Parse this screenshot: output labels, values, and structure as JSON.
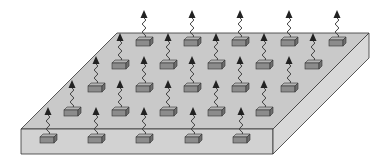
{
  "diagram": {
    "title": "",
    "colors": {
      "background": "#ffffff",
      "slab_top": "#c9c9c9",
      "slab_front": "#d2d2d2",
      "slab_side": "#d8d8d8",
      "slab_edge": "#333333",
      "node_fill": "#8c8c8c",
      "node_top": "#b4b4b4",
      "signal": "#444444",
      "arrow": "#222222"
    },
    "slab": {
      "top_face": [
        [
          117,
          33
        ],
        [
          369,
          33
        ],
        [
          273,
          129
        ],
        [
          21,
          129
        ]
      ],
      "front_face": [
        [
          21,
          129
        ],
        [
          273,
          129
        ],
        [
          273,
          154
        ],
        [
          21,
          154
        ]
      ],
      "side_face": [
        [
          273,
          129
        ],
        [
          369,
          33
        ],
        [
          369,
          58
        ],
        [
          273,
          154
        ]
      ]
    },
    "nodes": [
      {
        "row": 1,
        "x": 144,
        "y": 42
      },
      {
        "row": 1,
        "x": 192,
        "y": 42
      },
      {
        "row": 1,
        "x": 240,
        "y": 42
      },
      {
        "row": 1,
        "x": 289,
        "y": 42
      },
      {
        "row": 1,
        "x": 337,
        "y": 42
      },
      {
        "row": 2,
        "x": 120,
        "y": 65
      },
      {
        "row": 2,
        "x": 168,
        "y": 65
      },
      {
        "row": 2,
        "x": 216,
        "y": 65
      },
      {
        "row": 2,
        "x": 264,
        "y": 65
      },
      {
        "row": 2,
        "x": 313,
        "y": 65
      },
      {
        "row": 3,
        "x": 96,
        "y": 88
      },
      {
        "row": 3,
        "x": 144,
        "y": 88
      },
      {
        "row": 3,
        "x": 192,
        "y": 88
      },
      {
        "row": 3,
        "x": 240,
        "y": 88
      },
      {
        "row": 3,
        "x": 289,
        "y": 88
      },
      {
        "row": 4,
        "x": 72,
        "y": 112
      },
      {
        "row": 4,
        "x": 120,
        "y": 112
      },
      {
        "row": 4,
        "x": 168,
        "y": 112
      },
      {
        "row": 4,
        "x": 216,
        "y": 112
      },
      {
        "row": 4,
        "x": 264,
        "y": 112
      },
      {
        "row": 5,
        "x": 48,
        "y": 139
      },
      {
        "row": 5,
        "x": 96,
        "y": 139
      },
      {
        "row": 5,
        "x": 144,
        "y": 139
      },
      {
        "row": 5,
        "x": 193,
        "y": 139
      },
      {
        "row": 5,
        "x": 241,
        "y": 139
      }
    ],
    "node_icon": "sensor-node-with-antenna-icon",
    "signal_height": 28
  }
}
